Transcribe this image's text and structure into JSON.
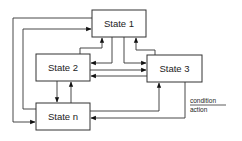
{
  "diagram": {
    "title": "",
    "states": [
      {
        "id": "s1",
        "label": "State 1",
        "x": 92,
        "y": 10,
        "w": 54,
        "h": 27
      },
      {
        "id": "s2",
        "label": "State 2",
        "x": 36,
        "y": 54,
        "w": 54,
        "h": 27
      },
      {
        "id": "s3",
        "label": "State 3",
        "x": 147,
        "y": 55,
        "w": 55,
        "h": 27
      },
      {
        "id": "sn",
        "label": "State n",
        "x": 36,
        "y": 103,
        "w": 54,
        "h": 27
      }
    ],
    "transitions": [
      {
        "from": "sn",
        "to": "s1",
        "route": "outer-left"
      },
      {
        "from": "sn",
        "to": "s1",
        "route": "inner-left"
      },
      {
        "from": "s2",
        "to": "s1"
      },
      {
        "from": "s1",
        "to": "s2"
      },
      {
        "from": "s1",
        "to": "s3"
      },
      {
        "from": "s3",
        "to": "s1"
      },
      {
        "from": "s2",
        "to": "s3"
      },
      {
        "from": "s3",
        "to": "s2"
      },
      {
        "from": "s2",
        "to": "sn"
      },
      {
        "from": "sn",
        "to": "s2"
      },
      {
        "from": "sn",
        "to": "s3"
      },
      {
        "from": "s3",
        "to": "sn"
      },
      {
        "from": "s1",
        "to": "sn",
        "route": "outer-left"
      }
    ],
    "legend": {
      "condition": "condition",
      "action": "action"
    }
  }
}
